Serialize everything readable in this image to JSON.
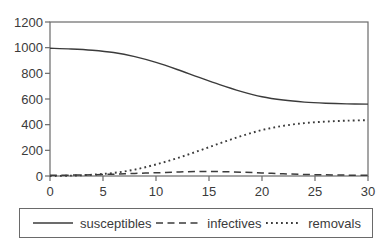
{
  "chart_data": {
    "type": "line",
    "title": "",
    "xlabel": "",
    "ylabel": "",
    "xlim": [
      0,
      30
    ],
    "ylim": [
      0,
      1200
    ],
    "xticks": [
      0,
      5,
      10,
      15,
      20,
      25,
      30
    ],
    "yticks": [
      0,
      200,
      400,
      600,
      800,
      1000,
      1200
    ],
    "grid": false,
    "legend_position": "bottom",
    "line_color": "#3b3b3b",
    "axis_color": "#6a6a6a",
    "background": "#ffffff",
    "x": [
      0,
      2,
      4,
      6,
      8,
      10,
      12,
      14,
      16,
      18,
      20,
      22,
      24,
      26,
      28,
      30
    ],
    "series": [
      {
        "name": "susceptibles",
        "style": "solid",
        "values": [
          995,
          990,
          980,
          962,
          930,
          885,
          830,
          770,
          712,
          660,
          618,
          592,
          576,
          567,
          562,
          560
        ]
      },
      {
        "name": "infectives",
        "style": "dashed",
        "values": [
          5,
          7,
          10,
          14,
          20,
          25,
          31,
          35,
          34,
          30,
          24,
          17,
          12,
          9,
          7,
          5
        ]
      },
      {
        "name": "removals",
        "style": "dotted",
        "values": [
          0,
          3,
          10,
          24,
          50,
          90,
          139,
          195,
          254,
          310,
          358,
          391,
          412,
          424,
          431,
          435
        ]
      }
    ]
  }
}
